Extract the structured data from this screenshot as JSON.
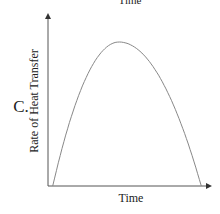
{
  "top_cut_label": "Time",
  "option_label": "C.",
  "chart_data": {
    "type": "line",
    "title": "",
    "xlabel": "Time",
    "ylabel": "Rate of Heat Transfer",
    "xlim": [
      0,
      1
    ],
    "ylim": [
      0,
      1
    ],
    "grid": false,
    "legend": "none",
    "series": [
      {
        "name": "rate",
        "shape": "inverted parabola",
        "x": [
          0.03,
          0.1,
          0.2,
          0.3,
          0.4,
          0.45,
          0.5,
          0.6,
          0.7,
          0.8,
          0.9,
          0.97
        ],
        "y": [
          0.0,
          0.36,
          0.68,
          0.88,
          0.98,
          1.0,
          0.99,
          0.9,
          0.72,
          0.46,
          0.14,
          0.0
        ]
      }
    ],
    "color": "#888888"
  }
}
